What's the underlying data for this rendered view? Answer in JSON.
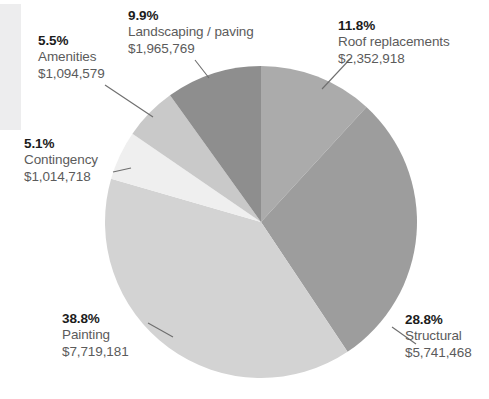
{
  "chart_data": {
    "type": "pie",
    "title": "",
    "subtitle": "",
    "xlabel": "",
    "ylabel": "",
    "legend_position": "callout-labels",
    "grid": false,
    "start_angle_deg": 0,
    "direction": "clockwise",
    "total_value": 19888633,
    "categories": [
      "Roof replacements",
      "Structural",
      "Painting",
      "Contingency",
      "Amenities",
      "Landscaping / paving"
    ],
    "values": [
      2352918,
      5741468,
      7719181,
      1014718,
      1094579,
      1965769
    ],
    "percentages": [
      11.8,
      28.8,
      38.8,
      5.1,
      5.5,
      9.9
    ],
    "colors": [
      "#ababab",
      "#9d9d9d",
      "#d3d3d3",
      "#efefef",
      "#c9c9c9",
      "#8e8e8e"
    ],
    "slices": [
      {
        "id": "roof",
        "label": "Roof replacements",
        "percent_text": "11.8%",
        "value_text": "$2,352,918",
        "value": 2352918,
        "percent": 11.8,
        "color": "#ababab"
      },
      {
        "id": "structural",
        "label": "Structural",
        "percent_text": "28.8%",
        "value_text": "$5,741,468",
        "value": 5741468,
        "percent": 28.8,
        "color": "#9d9d9d"
      },
      {
        "id": "painting",
        "label": "Painting",
        "percent_text": "38.8%",
        "value_text": "$7,719,181",
        "value": 7719181,
        "percent": 38.8,
        "color": "#d3d3d3"
      },
      {
        "id": "contingency",
        "label": "Contingency",
        "percent_text": "5.1%",
        "value_text": "$1,014,718",
        "value": 1014718,
        "percent": 5.1,
        "color": "#efefef"
      },
      {
        "id": "amenities",
        "label": "Amenities",
        "percent_text": "5.5%",
        "value_text": "$1,094,579",
        "value": 1094579,
        "percent": 5.5,
        "color": "#c9c9c9"
      },
      {
        "id": "landscaping",
        "label": "Landscaping / paving",
        "percent_text": "9.9%",
        "value_text": "$1,965,769",
        "value": 1965769,
        "percent": 9.9,
        "color": "#8e8e8e"
      }
    ]
  },
  "style": {
    "background": "#ffffff",
    "percent_color": "#1c1c1c",
    "label_color": "#5b5b5b",
    "leader_line_color": "#6e6e6e",
    "edge_band_color": "#ededee"
  },
  "geometry": {
    "center_x": 261,
    "center_y": 222,
    "radius": 156
  }
}
